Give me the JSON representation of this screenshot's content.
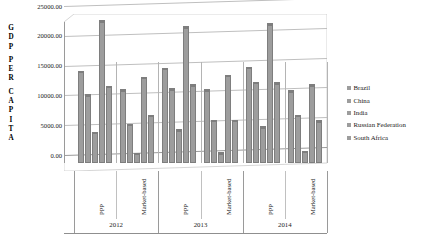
{
  "chart_data": {
    "type": "bar",
    "title": "",
    "xlabel": "",
    "ylabel": "GDP PER CAPITA",
    "ylim": [
      0,
      25000
    ],
    "ytick_labels": [
      "0.00",
      "5000.00",
      "10000.00",
      "15000.00",
      "20000.00",
      "25000.00"
    ],
    "ytick_values": [
      0,
      5000,
      10000,
      15000,
      20000,
      25000
    ],
    "grid": true,
    "legend_position": "right",
    "group_labels": [
      "2012",
      "2013",
      "2014"
    ],
    "categories": [
      "PPP",
      "Market-based",
      "PPP",
      "Market-based",
      "PPP",
      "Market-based"
    ],
    "series": [
      {
        "name": "Brazil",
        "values": [
          15200,
          12100,
          15700,
          12100,
          15950,
          11950
        ]
      },
      {
        "name": "China",
        "values": [
          11300,
          6350,
          12300,
          7050,
          13400,
          7850
        ]
      },
      {
        "name": "India",
        "values": [
          5000,
          1500,
          5450,
          1560,
          5900,
          1830
        ]
      },
      {
        "name": "Russian Federation",
        "values": [
          23700,
          14200,
          22700,
          14600,
          23200,
          12950
        ]
      },
      {
        "name": "South Africa",
        "values": [
          12700,
          7850,
          12950,
          7000,
          13300,
          6900
        ]
      }
    ],
    "colors": {
      "bar": "#9d9d9d",
      "bar_border": "#7e7e7e",
      "gridline": "#bfbfbf",
      "axis": "#9a9a9a",
      "text": "#1a1a1a"
    },
    "axis_title_letters": [
      "G",
      "D",
      "P",
      "",
      "P",
      "E",
      "R",
      "",
      "C",
      "A",
      "P",
      "I",
      "T",
      "A"
    ]
  }
}
